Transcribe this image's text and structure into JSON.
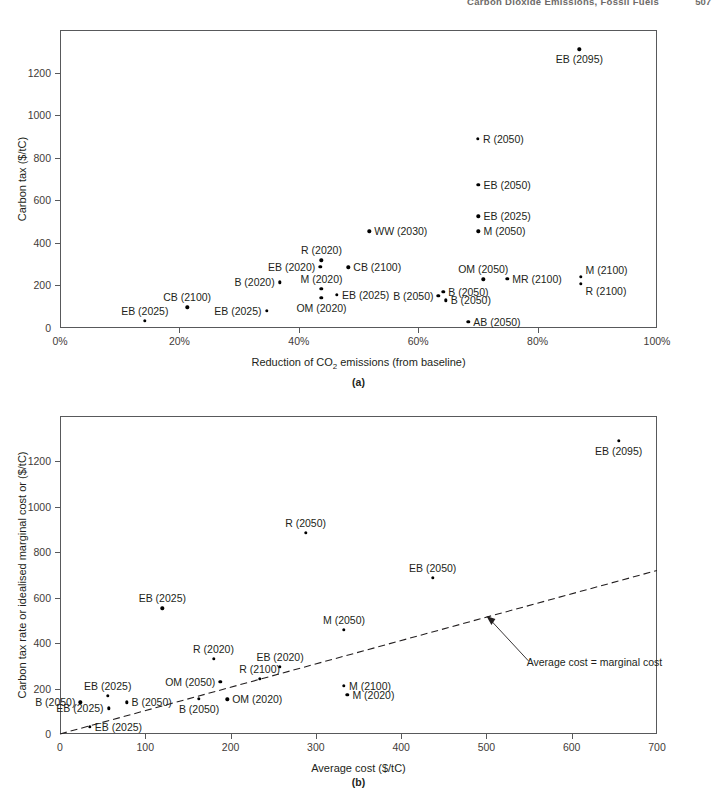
{
  "header": {
    "title": "Carbon Dioxide Emissions, Fossil Fuels",
    "page_number": "507"
  },
  "figures": [
    {
      "caption": "(a)",
      "chart_data": {
        "type": "scatter",
        "title": "",
        "xlabel": "Reduction of CO2 emissions (from baseline)",
        "ylabel": "Carbon tax ($/tC)",
        "xlim": [
          0,
          100
        ],
        "ylim": [
          0,
          1400
        ],
        "xticks": [
          "0%",
          "20%",
          "40%",
          "60%",
          "80%",
          "100%"
        ],
        "xtick_values": [
          0,
          20,
          40,
          60,
          80,
          100
        ],
        "yticks": [
          "0",
          "200",
          "400",
          "600",
          "800",
          "1000",
          "1200"
        ],
        "ytick_values": [
          0,
          200,
          400,
          600,
          800,
          1000,
          1200
        ],
        "grid": false,
        "legend": "none",
        "points": [
          {
            "label": "EB (2025)",
            "x": 14.2,
            "y": 35,
            "pos": "above"
          },
          {
            "label": "CB (2100)",
            "x": 21.3,
            "y": 98,
            "pos": "above"
          },
          {
            "label": "EB (2025)",
            "x": 34.6,
            "y": 82,
            "pos": "left"
          },
          {
            "label": "B (2020)",
            "x": 36.8,
            "y": 215,
            "pos": "left"
          },
          {
            "label": "EB (2020)",
            "x": 43.6,
            "y": 288,
            "pos": "left"
          },
          {
            "label": "R (2020)",
            "x": 43.8,
            "y": 318,
            "pos": "above"
          },
          {
            "label": "M (2020)",
            "x": 43.8,
            "y": 185,
            "pos": "above"
          },
          {
            "label": "OM (2020)",
            "x": 43.8,
            "y": 142,
            "pos": "below"
          },
          {
            "label": "EB (2025)",
            "x": 46.4,
            "y": 155,
            "pos": "right"
          },
          {
            "label": "CB (2100)",
            "x": 48.3,
            "y": 285,
            "pos": "right"
          },
          {
            "label": "WW (2030)",
            "x": 51.8,
            "y": 455,
            "pos": "right"
          },
          {
            "label": "B (2050)",
            "x": 63.4,
            "y": 152,
            "pos": "left"
          },
          {
            "label": "B (2050)",
            "x": 64.2,
            "y": 170,
            "pos": "right"
          },
          {
            "label": "B (2050)",
            "x": 64.6,
            "y": 130,
            "pos": "right"
          },
          {
            "label": "AB (2050)",
            "x": 68.4,
            "y": 28,
            "pos": "right"
          },
          {
            "label": "M (2050)",
            "x": 70.1,
            "y": 455,
            "pos": "right"
          },
          {
            "label": "EB (2025)",
            "x": 70.1,
            "y": 525,
            "pos": "right"
          },
          {
            "label": "EB (2050)",
            "x": 70.1,
            "y": 672,
            "pos": "right"
          },
          {
            "label": "R (2050)",
            "x": 70.0,
            "y": 888,
            "pos": "right"
          },
          {
            "label": "OM (2050)",
            "x": 70.9,
            "y": 228,
            "pos": "above"
          },
          {
            "label": "MR (2100)",
            "x": 74.9,
            "y": 230,
            "pos": "right"
          },
          {
            "label": "M (2100)",
            "x": 87.2,
            "y": 240,
            "pos": "right-up"
          },
          {
            "label": "R (2100)",
            "x": 87.2,
            "y": 208,
            "pos": "right-down"
          },
          {
            "label": "EB (2095)",
            "x": 87.0,
            "y": 1310,
            "pos": "below"
          }
        ]
      }
    },
    {
      "caption": "(b)",
      "chart_data": {
        "type": "scatter",
        "title": "",
        "xlabel": "Average cost ($/tC)",
        "ylabel": "Carbon tax rate or idealised marginal cost or ($/tC)",
        "xlim": [
          0,
          700
        ],
        "ylim": [
          0,
          1400
        ],
        "xticks": [
          "0",
          "100",
          "200",
          "300",
          "400",
          "500",
          "600",
          "700"
        ],
        "xtick_values": [
          0,
          100,
          200,
          300,
          400,
          500,
          600,
          700
        ],
        "yticks": [
          "0",
          "200",
          "400",
          "600",
          "800",
          "1000",
          "1200"
        ],
        "ytick_values": [
          0,
          200,
          400,
          600,
          800,
          1000,
          1200
        ],
        "grid": false,
        "legend": "none",
        "reference_line": {
          "label": "Average cost = marginal cost",
          "style": "dashed",
          "from": [
            0,
            0
          ],
          "to": [
            700,
            720
          ]
        },
        "points": [
          {
            "label": "EB (2025)",
            "x": 35,
            "y": 33,
            "pos": "right"
          },
          {
            "label": "EB (2025)",
            "x": 57,
            "y": 113,
            "pos": "left"
          },
          {
            "label": "B (2050)",
            "x": 24,
            "y": 140,
            "pos": "left"
          },
          {
            "label": "EB (2025)",
            "x": 56,
            "y": 168,
            "pos": "above"
          },
          {
            "label": "B (2050)",
            "x": 78,
            "y": 140,
            "pos": "right"
          },
          {
            "label": "EB (2025)",
            "x": 120,
            "y": 553,
            "pos": "above"
          },
          {
            "label": "B (2050)",
            "x": 163,
            "y": 155,
            "pos": "below"
          },
          {
            "label": "OM (2050)",
            "x": 188,
            "y": 230,
            "pos": "left"
          },
          {
            "label": "OM (2020)",
            "x": 196,
            "y": 152,
            "pos": "right"
          },
          {
            "label": "R (2020)",
            "x": 180,
            "y": 330,
            "pos": "above"
          },
          {
            "label": "R (2100)",
            "x": 234,
            "y": 243,
            "pos": "above"
          },
          {
            "label": "EB (2020)",
            "x": 258,
            "y": 297,
            "pos": "above"
          },
          {
            "label": "R (2050)",
            "x": 288,
            "y": 885,
            "pos": "above"
          },
          {
            "label": "M (2050)",
            "x": 333,
            "y": 460,
            "pos": "above"
          },
          {
            "label": "M (2100)",
            "x": 333,
            "y": 212,
            "pos": "right"
          },
          {
            "label": "M (2020)",
            "x": 337,
            "y": 172,
            "pos": "right"
          },
          {
            "label": "EB (2050)",
            "x": 437,
            "y": 688,
            "pos": "above"
          },
          {
            "label": "EB (2095)",
            "x": 655,
            "y": 1290,
            "pos": "below"
          }
        ]
      }
    }
  ]
}
